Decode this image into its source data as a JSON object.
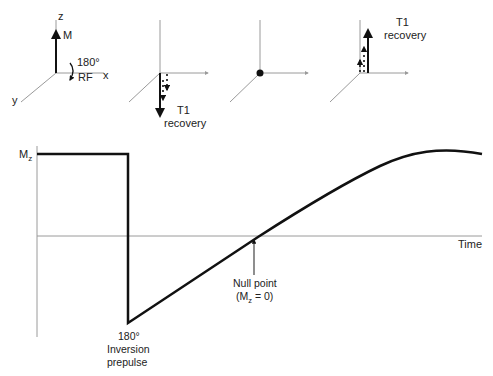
{
  "panels": [
    {
      "id": "initial",
      "axis_labels": {
        "z": "z",
        "x": "x",
        "y": "y"
      },
      "vector_label": "M",
      "pulse_angle": "180°",
      "pulse_label": "RF"
    },
    {
      "id": "inverted",
      "caption_line1": "T1",
      "caption_line2": "recovery"
    },
    {
      "id": "null"
    },
    {
      "id": "recovered",
      "caption_line1": "T1",
      "caption_line2": "recovery"
    }
  ],
  "graph": {
    "y_label_main": "M",
    "y_label_sub": "z",
    "x_label": "Time",
    "null_point_line1": "Null point",
    "null_point_line2_prefix": "(M",
    "null_point_line2_sub": "z",
    "null_point_line2_suffix": " = 0)",
    "inversion_line1": "180°",
    "inversion_line2": "Inversion",
    "inversion_line3": "prepulse"
  },
  "colors": {
    "axis": "#9a9a9a",
    "curve": "#111111",
    "text": "#222222"
  }
}
